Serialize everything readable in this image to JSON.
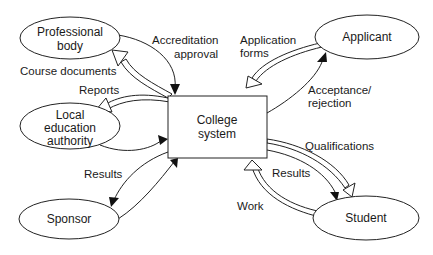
{
  "diagram": {
    "type": "context-diagram",
    "center": {
      "label_line1": "College",
      "label_line2": "system"
    },
    "nodes": [
      {
        "id": "professional-body",
        "line1": "Professional",
        "line2": "body"
      },
      {
        "id": "local-education-authority",
        "line1": "Local",
        "line2": "education",
        "line3": "authority"
      },
      {
        "id": "sponsor",
        "line1": "Sponsor"
      },
      {
        "id": "applicant",
        "line1": "Applicant"
      },
      {
        "id": "student",
        "line1": "Student"
      }
    ],
    "flows": [
      {
        "from": "professional-body",
        "to": "college-system",
        "style": "line",
        "line1": "Accreditation",
        "line2": "approval"
      },
      {
        "from": "college-system",
        "to": "professional-body",
        "style": "hollow",
        "line1": "Course documents"
      },
      {
        "from": "college-system",
        "to": "local-education-authority",
        "style": "hollow",
        "line1": "Reports"
      },
      {
        "from": "local-education-authority",
        "to": "college-system",
        "style": "line"
      },
      {
        "from": "college-system",
        "to": "sponsor",
        "style": "line",
        "line1": "Results"
      },
      {
        "from": "sponsor",
        "to": "college-system",
        "style": "line"
      },
      {
        "from": "applicant",
        "to": "college-system",
        "style": "hollow",
        "line1": "Application",
        "line2": "forms"
      },
      {
        "from": "college-system",
        "to": "applicant",
        "style": "line",
        "line1": "Acceptance/",
        "line2": "rejection"
      },
      {
        "from": "college-system",
        "to": "student",
        "style": "hollow",
        "line1": "Qualifications"
      },
      {
        "from": "college-system",
        "to": "student",
        "style": "line",
        "line1": "Results"
      },
      {
        "from": "student",
        "to": "college-system",
        "style": "hollow",
        "line1": "Work"
      }
    ]
  }
}
